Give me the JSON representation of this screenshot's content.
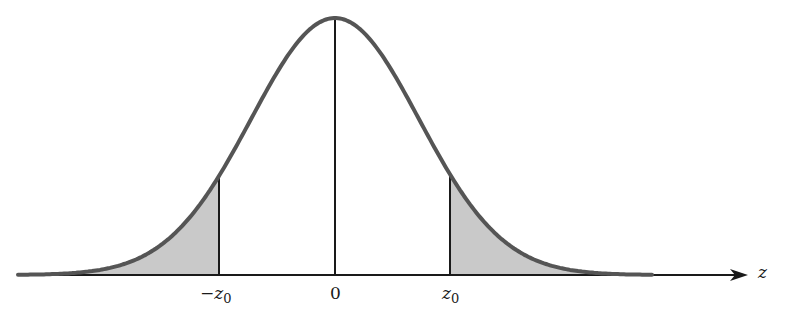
{
  "figure": {
    "axis_label": "z",
    "ticks": [
      {
        "name": "neg-z0",
        "prefix": "−",
        "var": "z",
        "sub": "0",
        "x": 219
      },
      {
        "name": "zero",
        "prefix": "",
        "var": "",
        "sub": "",
        "text": "0",
        "x": 335
      },
      {
        "name": "pos-z0",
        "prefix": "",
        "var": "z",
        "sub": "0",
        "x": 450
      }
    ],
    "colors": {
      "curve": "#555555",
      "shade": "#c9c9c9",
      "axis": "#1a1a1a",
      "background": "#ffffff"
    },
    "geometry": {
      "baseline_y": 275,
      "center_x": 335,
      "peak_y": 18,
      "sigma_px": 84,
      "curve_x_start": 18,
      "curve_x_end": 652,
      "axis_x_start": 18,
      "axis_x_end": 748,
      "left_cut_x": 219,
      "right_cut_x": 450
    }
  }
}
